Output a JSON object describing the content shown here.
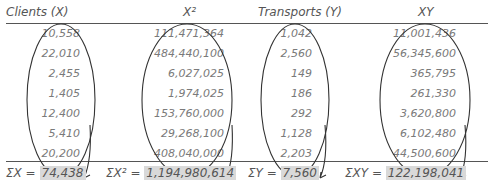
{
  "table": {
    "headers": [
      "Clients (X)",
      "X²",
      "Transports (Y)",
      "XY"
    ],
    "rows": [
      [
        "10,558",
        "111,471,364",
        "1,042",
        "11,001,436"
      ],
      [
        "22,010",
        "484,440,100",
        "2,560",
        "56,345,600"
      ],
      [
        "2,455",
        "6,027,025",
        "149",
        "365,795"
      ],
      [
        "1,405",
        "1,974,025",
        "186",
        "261,330"
      ],
      [
        "12,400",
        "153,760,000",
        "292",
        "3,620,800"
      ],
      [
        "5,410",
        "29,268,100",
        "1,128",
        "6,102,480"
      ],
      [
        "20,200",
        "408,040,000",
        "2,203",
        "44,500,600"
      ]
    ],
    "sums": [
      {
        "label": "ΣX =",
        "value": "74,438"
      },
      {
        "label": "ΣX² =",
        "value": "1,194,980,614"
      },
      {
        "label": "ΣY =",
        "value": "7,560"
      },
      {
        "label": "ΣXY =",
        "value": "122,198,041"
      }
    ]
  },
  "colors": {
    "line": "#555555",
    "highlight": "#d9d9d9",
    "text": "#7a7a7a"
  }
}
